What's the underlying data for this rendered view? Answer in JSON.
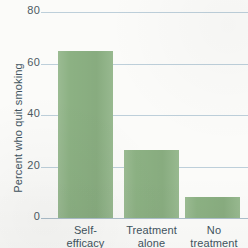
{
  "chart_data": {
    "type": "bar",
    "title": "",
    "xlabel": "",
    "ylabel": "Percent who quit smoking",
    "categories": [
      "Self-\nefficacy",
      "Treatment\nalone",
      "No\ntreatment"
    ],
    "category_lines": [
      [
        "Self-",
        "efficacy"
      ],
      [
        "Treatment",
        "alone"
      ],
      [
        "No",
        "treatment"
      ]
    ],
    "values": [
      65,
      26.5,
      8
    ],
    "ylim": [
      0,
      80
    ],
    "yticks": [
      0,
      20,
      40,
      60,
      80
    ],
    "ytick_labels": [
      "0",
      "20",
      "40",
      "60",
      "80"
    ],
    "grid": true,
    "legend": false,
    "bar_color": "#8cb183",
    "grid_color": "#b9ccd8",
    "axis_color": "#a9bcc8",
    "text_color": "#3f5460",
    "background": "#fbfbf9"
  }
}
